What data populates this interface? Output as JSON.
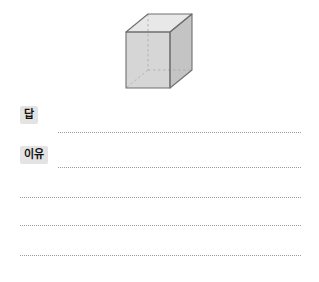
{
  "page": {
    "background_color": "#ffffff",
    "width": 319,
    "height": 282
  },
  "figure": {
    "name": "rectangular-prism",
    "description_icon": "cube-icon",
    "style": {
      "top_face_color": "#e6e6e6",
      "left_face_color": "#d5d5d5",
      "right_face_color": "#c6c6c6",
      "edge_color": "#6e6e6e",
      "hidden_edge_color": "#a8a8a8"
    }
  },
  "worksheet": {
    "answer": {
      "label": "답",
      "value": "",
      "placeholder": ""
    },
    "reason": {
      "label": "이유",
      "value": "",
      "placeholder": ""
    },
    "extra_lines": [
      {
        "value": ""
      },
      {
        "value": ""
      },
      {
        "value": ""
      }
    ]
  }
}
